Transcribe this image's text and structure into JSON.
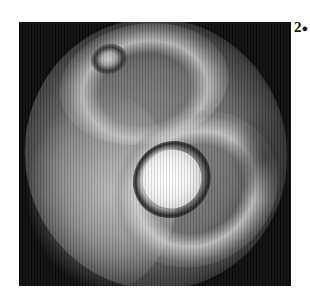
{
  "figure": {
    "panel_label": "2",
    "panel_label_suffix": "●",
    "image_description": "grayscale scan with bright central oval surrounded by dark ring, smaller dark ring upper-left"
  }
}
